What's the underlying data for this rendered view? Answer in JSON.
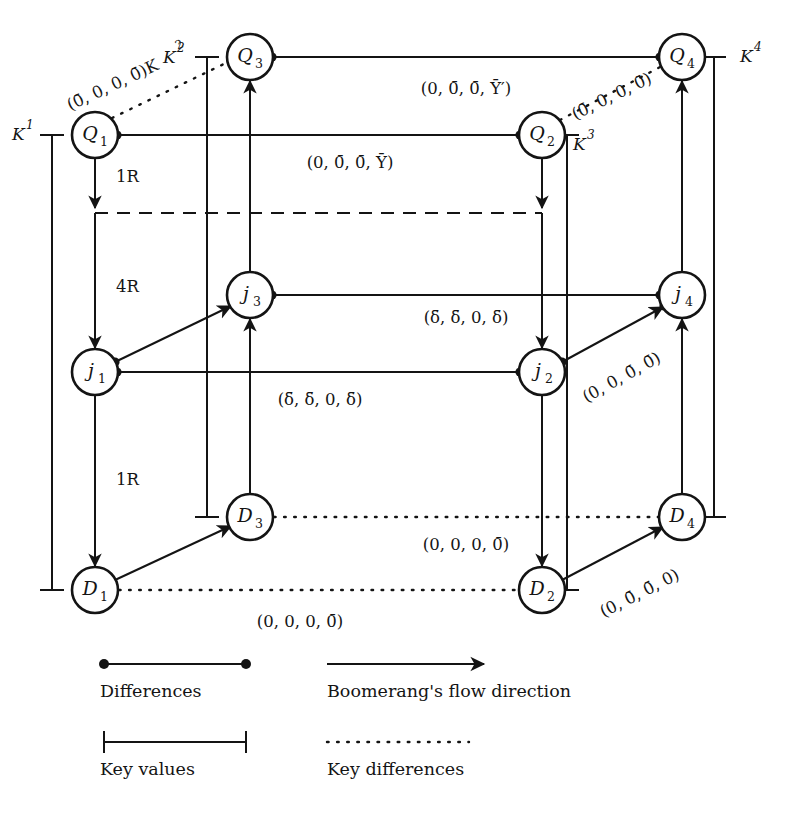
{
  "figure": {
    "type": "boomerang-attack-diagram",
    "background": "#ffffff",
    "ink": "#141414"
  },
  "nodes": [
    {
      "id": "Q1",
      "base": "Q",
      "sub": "1",
      "x": 95,
      "y": 135
    },
    {
      "id": "Q2",
      "base": "Q",
      "sub": "2",
      "x": 542,
      "y": 135
    },
    {
      "id": "Q3",
      "base": "Q",
      "sub": "3",
      "x": 250,
      "y": 57
    },
    {
      "id": "Q4",
      "base": "Q",
      "sub": "4",
      "x": 682,
      "y": 57
    },
    {
      "id": "j1",
      "base": "j",
      "sub": "1",
      "x": 95,
      "y": 372
    },
    {
      "id": "j2",
      "base": "j",
      "sub": "2",
      "x": 542,
      "y": 372
    },
    {
      "id": "j3",
      "base": "j",
      "sub": "3",
      "x": 250,
      "y": 295
    },
    {
      "id": "j4",
      "base": "j",
      "sub": "4",
      "x": 682,
      "y": 295
    },
    {
      "id": "D1",
      "base": "D",
      "sub": "1",
      "x": 95,
      "y": 590
    },
    {
      "id": "D2",
      "base": "D",
      "sub": "2",
      "x": 542,
      "y": 590
    },
    {
      "id": "D3",
      "base": "D",
      "sub": "3",
      "x": 250,
      "y": 517
    },
    {
      "id": "D4",
      "base": "D",
      "sub": "4",
      "x": 682,
      "y": 517
    }
  ],
  "keys": [
    {
      "id": "K1",
      "label": "K",
      "sup": "1",
      "text_x": 18,
      "text_y": 135
    },
    {
      "id": "K2",
      "label": "K",
      "sup": "2",
      "text_x": 176,
      "text_y": 57
    },
    {
      "id": "K3",
      "label": "K",
      "sup": "3",
      "text_x": 575,
      "text_y": 143
    },
    {
      "id": "K4",
      "label": "K",
      "sup": "4",
      "text_x": 730,
      "text_y": 57
    }
  ],
  "round_labels": [
    {
      "id": "r1-top",
      "text": "1R",
      "x": 116,
      "y": 175
    },
    {
      "id": "r4-middle",
      "text": "4R",
      "x": 116,
      "y": 285
    },
    {
      "id": "r1-bottom",
      "text": "1R",
      "x": 116,
      "y": 478
    }
  ],
  "edge_labels": [
    {
      "id": "q3q4",
      "text": "(0, 0̄, 0̄, Ȳ′)",
      "x": 466,
      "y": 89
    },
    {
      "id": "q1q2",
      "text": "(0, 0̄, 0̄, Ȳ)",
      "x": 350,
      "y": 163
    },
    {
      "id": "q1q3",
      "text": "(0̄, 0, 0, 0̄)K",
      "sup": "2",
      "x": 88,
      "y": 72
    },
    {
      "id": "q2q4",
      "text": "(0̄, 0, 0, 0̄)",
      "x": 612,
      "y": 97
    },
    {
      "id": "j3j4",
      "text": "(δ̄, δ̄, 0, δ̄)",
      "x": 466,
      "y": 318
    },
    {
      "id": "j1j2",
      "text": "(δ̄, δ̄, 0, δ̄)",
      "x": 320,
      "y": 400
    },
    {
      "id": "j2j4",
      "text": "(0, 0, 0̄, 0̄)",
      "x": 622,
      "y": 378
    },
    {
      "id": "d3d4",
      "text": "(0, 0, 0, 0̄)",
      "x": 466,
      "y": 545
    },
    {
      "id": "d1d2",
      "text": "(0, 0, 0, 0̄)",
      "x": 300,
      "y": 622
    },
    {
      "id": "d2d4",
      "text": "(0, 0̄, 0̄, 0)",
      "x": 640,
      "y": 594
    }
  ],
  "legend": {
    "items": [
      {
        "id": "differences",
        "label": "Differences",
        "marker": "dot-line"
      },
      {
        "id": "flow-direction",
        "label": "Boomerang's flow direction",
        "marker": "arrow"
      },
      {
        "id": "key-values",
        "label": "Key values",
        "marker": "bracket"
      },
      {
        "id": "key-differences",
        "label": "Key differences",
        "marker": "dotted"
      }
    ]
  }
}
